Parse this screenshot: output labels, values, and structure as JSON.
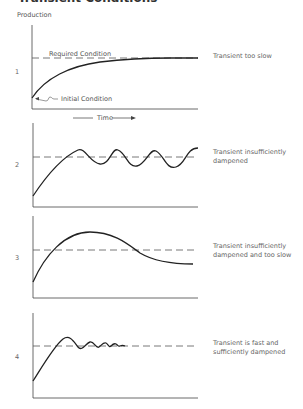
{
  "title": "Transient Conditions",
  "y_axis_label": "Production",
  "x_axis_label": "Time",
  "annotations": {
    "required_condition": "Required Condition",
    "initial_condition": "Initial Condition"
  },
  "panels": [
    {
      "number": "1",
      "description_line1": "Transient too slow",
      "description_line2": ""
    },
    {
      "number": "2",
      "description_line1": "Transient insufficiently",
      "description_line2": "dampened"
    },
    {
      "number": "3",
      "description_line1": "Transient insufficiently",
      "description_line2": "dampened and too slow"
    },
    {
      "number": "4",
      "description_line1": "Transient is fast and",
      "description_line2": "sufficiently dampened"
    }
  ],
  "colors": {
    "curve": "#222222",
    "axis": "#444444",
    "dashed": "#555555",
    "text": "#666666"
  }
}
